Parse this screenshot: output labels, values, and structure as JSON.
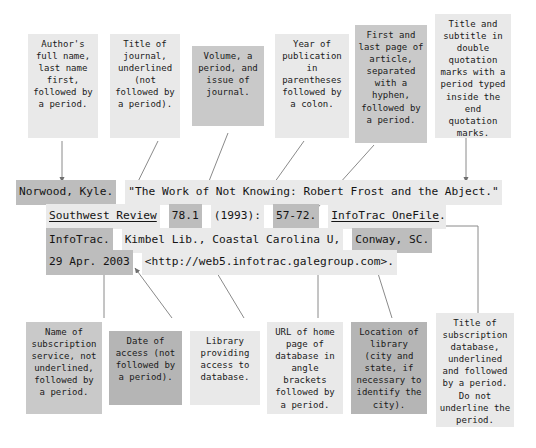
{
  "figure": {
    "kind": "mla-citation-annotation-diagram",
    "colors": {
      "shade_light": "#e9e9e9",
      "shade_medium": "#c9c9c9",
      "shade_dark": "#b5b5b5",
      "text": "#1a1a1a",
      "connector": "#8a8a8a",
      "background": "#ffffff"
    }
  },
  "top_callouts": [
    {
      "id": "author",
      "text": "Author's full name, last name first, followed by a period."
    },
    {
      "id": "journal",
      "text": "Title of journal, underlined (not followed by a period)."
    },
    {
      "id": "volume",
      "text": "Volume, a period, and issue of journal."
    },
    {
      "id": "year",
      "text": "Year of publication in parentheses followed by a colon."
    },
    {
      "id": "pages",
      "text": "First and last page of article, separated with a hyphen, followed by a period."
    },
    {
      "id": "title",
      "text": "Title and subtitle in double quotation marks with a period typed inside the end quotation marks."
    }
  ],
  "bottom_callouts": [
    {
      "id": "service",
      "text": "Name of subscription service, not underlined, followed by a period."
    },
    {
      "id": "date",
      "text": "Date of access (not followed by a period)."
    },
    {
      "id": "library",
      "text": "Library providing access to database."
    },
    {
      "id": "url",
      "text": "URL of home page of database in angle brackets followed by a period."
    },
    {
      "id": "location",
      "text": "Location of library (city and state, if necessary to identify the city)."
    },
    {
      "id": "database",
      "text": "Title of subscription database, underlined and followed by a period. Do not underline the period."
    }
  ],
  "citation": {
    "line1": [
      {
        "id": "author-name",
        "text": "Norwood, Kyle."
      },
      {
        "id": "article-title",
        "text": "\"The Work of Not Knowing: Robert Frost and the Abject.\""
      }
    ],
    "line2": [
      {
        "id": "journal-title",
        "text": "Southwest Review"
      },
      {
        "id": "volume-issue",
        "text": "78.1"
      },
      {
        "id": "year",
        "text": "(1993):"
      },
      {
        "id": "page-range",
        "text": "57-72."
      },
      {
        "id": "database-name",
        "text": "InfoTrac OneFile"
      },
      {
        "id": "database-period",
        "text": "."
      }
    ],
    "line3": [
      {
        "id": "service-name",
        "text": "InfoTrac."
      },
      {
        "id": "library-name",
        "text": "Kimbel Lib., Coastal Carolina U,"
      },
      {
        "id": "library-city",
        "text": "Conway, SC."
      }
    ],
    "line4": [
      {
        "id": "access-date",
        "text": "29 Apr. 2003"
      },
      {
        "id": "database-url",
        "text": "<http://web5.infotrac.galegroup.com>."
      }
    ]
  }
}
